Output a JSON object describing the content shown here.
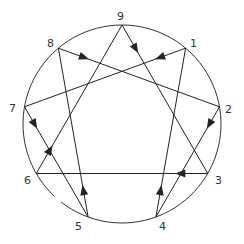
{
  "diagram": {
    "points": [
      {
        "id": "9",
        "label": "9"
      },
      {
        "id": "1",
        "label": "1"
      },
      {
        "id": "2",
        "label": "2"
      },
      {
        "id": "3",
        "label": "3"
      },
      {
        "id": "4",
        "label": "4"
      },
      {
        "id": "5",
        "label": "5"
      },
      {
        "id": "6",
        "label": "6"
      },
      {
        "id": "7",
        "label": "7"
      },
      {
        "id": "8",
        "label": "8"
      }
    ],
    "edges": [
      {
        "from": "9",
        "to": "3"
      },
      {
        "from": "3",
        "to": "6"
      },
      {
        "from": "6",
        "to": "9"
      },
      {
        "from": "1",
        "to": "7"
      },
      {
        "from": "7",
        "to": "5"
      },
      {
        "from": "5",
        "to": "8"
      },
      {
        "from": "8",
        "to": "2"
      },
      {
        "from": "2",
        "to": "4"
      },
      {
        "from": "4",
        "to": "1"
      }
    ],
    "colors": {
      "line": "#222222",
      "label": "#333333",
      "background": "#ffffff"
    }
  }
}
